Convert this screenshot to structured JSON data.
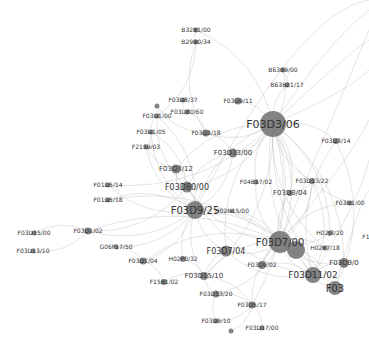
{
  "graph": {
    "type": "network",
    "node_color": "#6e6e6e",
    "edge_color": "#b8b8b8",
    "nodes": [
      {
        "id": "B32B1/00",
        "label": "B32B1/00",
        "x": 196,
        "y": 30,
        "r": 2.5,
        "fs": 6
      },
      {
        "id": "B29B0/34",
        "label": "B29B0/34",
        "x": 196,
        "y": 42,
        "r": 2.5,
        "fs": 6
      },
      {
        "id": "B63B9/00",
        "label": "B63B9/00",
        "x": 283,
        "y": 70,
        "r": 2.5,
        "fs": 6
      },
      {
        "id": "B63B21/17",
        "label": "B63B21/17",
        "x": 287,
        "y": 85,
        "r": 2.5,
        "fs": 6
      },
      {
        "id": "F03D3/06",
        "label": "F03D3/06",
        "x": 273,
        "y": 124,
        "r": 13,
        "fs": 11
      },
      {
        "id": "F03D8/37",
        "label": "F03D8/37",
        "x": 183,
        "y": 100,
        "r": 2.5,
        "fs": 6
      },
      {
        "id": "F03D9/11",
        "label": "F03D9/11",
        "x": 238,
        "y": 101,
        "r": 3.5,
        "fs": 6
      },
      {
        "id": "F03D80/60",
        "label": "F03D80/60",
        "x": 187,
        "y": 112,
        "r": 2.5,
        "fs": 6
      },
      {
        "id": "F03D1/00",
        "label": "F03D1/00",
        "x": 157,
        "y": 116,
        "r": 2.5,
        "fs": 6
      },
      {
        "id": "F03D1/05",
        "label": "F03D1/05",
        "x": 151,
        "y": 132,
        "r": 2.5,
        "fs": 6
      },
      {
        "id": "F03D3/18",
        "label": "F03D3/18",
        "x": 206,
        "y": 133,
        "r": 3.5,
        "fs": 6
      },
      {
        "id": "F21S9/03",
        "label": "F21S9/03",
        "x": 146,
        "y": 147,
        "r": 2.5,
        "fs": 6
      },
      {
        "id": "F03D13/00",
        "label": "F03D13/00",
        "x": 233,
        "y": 153,
        "r": 4.5,
        "fs": 7
      },
      {
        "id": "F03D3/14",
        "label": "F03D3/14",
        "x": 336,
        "y": 141,
        "r": 3,
        "fs": 6
      },
      {
        "id": "F03D3/12",
        "label": "F03D3/12",
        "x": 176,
        "y": 169,
        "r": 4.5,
        "fs": 7
      },
      {
        "id": "F03D80/00",
        "label": "F03D80/00",
        "x": 187,
        "y": 187,
        "r": 5.5,
        "fs": 8
      },
      {
        "id": "F04B17/02",
        "label": "F04B17/02",
        "x": 256,
        "y": 182,
        "r": 2.5,
        "fs": 6
      },
      {
        "id": "F03D13/22",
        "label": "F03D13/22",
        "x": 312,
        "y": 181,
        "r": 3,
        "fs": 6
      },
      {
        "id": "F03D3/04",
        "label": "F03D3/04",
        "x": 290,
        "y": 193,
        "r": 3,
        "fs": 7
      },
      {
        "id": "F01D5/14",
        "label": "F01D5/14",
        "x": 108,
        "y": 185,
        "r": 2.5,
        "fs": 6
      },
      {
        "id": "F01D5/18",
        "label": "F01D5/18",
        "x": 108,
        "y": 200,
        "r": 2.5,
        "fs": 6
      },
      {
        "id": "F03D1/00b",
        "label": "F03D1/00",
        "x": 350,
        "y": 203,
        "r": 2.5,
        "fs": 6
      },
      {
        "id": "F03D9/25",
        "label": "F03D9/25",
        "x": 195,
        "y": 210,
        "r": 9,
        "fs": 10
      },
      {
        "id": "H02N15/00",
        "label": "H02N15/00",
        "x": 232,
        "y": 211,
        "r": 2,
        "fs": 6
      },
      {
        "id": "F03D15/00",
        "label": "F03D15/00",
        "x": 34,
        "y": 233,
        "r": 2.5,
        "fs": 6
      },
      {
        "id": "F03D1/02",
        "label": "F03D1/02",
        "x": 88,
        "y": 231,
        "r": 3.5,
        "fs": 6
      },
      {
        "id": "F03D13/10",
        "label": "F03D13/10",
        "x": 33,
        "y": 251,
        "r": 2.5,
        "fs": 6
      },
      {
        "id": "G06F17/50",
        "label": "G06F17/50",
        "x": 116,
        "y": 247,
        "r": 2.5,
        "fs": 6
      },
      {
        "id": "F03D1/04",
        "label": "F03D1/04",
        "x": 143,
        "y": 261,
        "r": 3.5,
        "fs": 6
      },
      {
        "id": "F03D7/04",
        "label": "F03D7/04",
        "x": 226,
        "y": 251,
        "r": 5.5,
        "fs": 8
      },
      {
        "id": "H02P0/32",
        "label": "H02P0/32",
        "x": 183,
        "y": 259,
        "r": 3,
        "fs": 6
      },
      {
        "id": "F03D7/00",
        "label": "F03D7/00",
        "x": 280,
        "y": 242,
        "r": 11,
        "fs": 10
      },
      {
        "id": "F03D7/00b",
        "label": "",
        "x": 296,
        "y": 250,
        "r": 9,
        "fs": 0
      },
      {
        "id": "H02J3/20",
        "label": "H02J3/20",
        "x": 330,
        "y": 233,
        "r": 2.5,
        "fs": 6
      },
      {
        "id": "F1",
        "label": "F1",
        "x": 366,
        "y": 237,
        "r": 0,
        "fs": 6
      },
      {
        "id": "H02K7/18",
        "label": "H02K7/18",
        "x": 325,
        "y": 248,
        "r": 2.5,
        "fs": 6
      },
      {
        "id": "F03D9/02",
        "label": "F03D9/02",
        "x": 262,
        "y": 265,
        "r": 4,
        "fs": 6
      },
      {
        "id": "F03D9/0x",
        "label": "F03D9/0",
        "x": 344,
        "y": 263,
        "r": 5,
        "fs": 7
      },
      {
        "id": "F03D11/02",
        "label": "F03D11/02",
        "x": 313,
        "y": 275,
        "r": 8,
        "fs": 9
      },
      {
        "id": "F03",
        "label": "F03",
        "x": 335,
        "y": 288,
        "r": 7,
        "fs": 10
      },
      {
        "id": "F03D15/10",
        "label": "F03D15/10",
        "x": 204,
        "y": 276,
        "r": 4,
        "fs": 7
      },
      {
        "id": "F15B1/02",
        "label": "F15B1/02",
        "x": 164,
        "y": 282,
        "r": 3,
        "fs": 6
      },
      {
        "id": "F03D13/20",
        "label": "F03D13/20",
        "x": 216,
        "y": 294,
        "r": 3.5,
        "fs": 6
      },
      {
        "id": "F03D5/17",
        "label": "F03D5/17",
        "x": 252,
        "y": 305,
        "r": 3.5,
        "fs": 6
      },
      {
        "id": "F03D9/10",
        "label": "F03D9/10",
        "x": 216,
        "y": 321,
        "r": 2.5,
        "fs": 6
      },
      {
        "id": "F03D17/00",
        "label": "F03D17/00",
        "x": 262,
        "y": 328,
        "r": 2.5,
        "fs": 6
      },
      {
        "id": "iso1",
        "label": "",
        "x": 231,
        "y": 331,
        "r": 2.5,
        "fs": 0
      },
      {
        "id": "iso2",
        "label": "",
        "x": 157,
        "y": 106,
        "r": 2.5,
        "fs": 0
      }
    ],
    "edges": [
      [
        "F03D3/06",
        "F03D7/00"
      ],
      [
        "F03D3/06",
        "F03D9/25"
      ],
      [
        "F03D3/06",
        "F03D80/00"
      ],
      [
        "F03D3/06",
        "F03D11/02"
      ],
      [
        "F03D3/06",
        "F03D13/00"
      ],
      [
        "F03D3/06",
        "F03D3/12"
      ],
      [
        "F03D3/06",
        "F03D3/18"
      ],
      [
        "F03D3/06",
        "F03D9/11"
      ],
      [
        "F03D3/06",
        "F03D3/04"
      ],
      [
        "F03D3/06",
        "F03D13/22"
      ],
      [
        "F03D3/06",
        "F03D3/14"
      ],
      [
        "F03D3/06",
        "F03D1/00b"
      ],
      [
        "F03D3/06",
        "H02J3/20"
      ],
      [
        "F03D3/06",
        "H02K7/18"
      ],
      [
        "F03D3/06",
        "F03D9/02"
      ],
      [
        "F03D3/06",
        "F03D7/04"
      ],
      [
        "F03D3/06",
        "F03D15/10"
      ],
      [
        "F03D3/06",
        "F03"
      ],
      [
        "F03D3/06",
        "B63B21/17"
      ],
      [
        "F03D3/06",
        "B63B9/00"
      ],
      [
        "F03D3/06",
        "F03D9/0x"
      ],
      [
        "F03D3/06",
        "F04B17/02"
      ],
      [
        "F03D3/06",
        "F03D5/17"
      ],
      [
        "F03D3/06",
        "B32B1/00"
      ],
      [
        "F03D9/25",
        "F03D7/00"
      ],
      [
        "F03D9/25",
        "F03D80/00"
      ],
      [
        "F03D9/25",
        "F03D1/02"
      ],
      [
        "F03D9/25",
        "F03D7/04"
      ],
      [
        "F03D9/25",
        "F03D1/04"
      ],
      [
        "F03D9/25",
        "F03D13/00"
      ],
      [
        "F03D9/25",
        "F03D3/12"
      ],
      [
        "F03D9/25",
        "H02N15/00"
      ],
      [
        "F03D9/25",
        "F03D11/02"
      ],
      [
        "F03D9/25",
        "H02P0/32"
      ],
      [
        "F03D9/25",
        "F01D5/14"
      ],
      [
        "F03D9/25",
        "F01D5/18"
      ],
      [
        "F03D9/25",
        "F03D1/05"
      ],
      [
        "F03D9/25",
        "F03D1/00"
      ],
      [
        "F03D9/25",
        "G06F17/50"
      ],
      [
        "F03D9/25",
        "F03D15/10"
      ],
      [
        "F03D9/25",
        "F21S9/03"
      ],
      [
        "F03D7/00",
        "F03D11/02"
      ],
      [
        "F03D7/00",
        "F03D7/04"
      ],
      [
        "F03D7/00",
        "F03D9/02"
      ],
      [
        "F03D7/00",
        "H02K7/18"
      ],
      [
        "F03D7/00",
        "H02J3/20"
      ],
      [
        "F03D7/00",
        "F03D80/00"
      ],
      [
        "F03D7/00",
        "F03D15/10"
      ],
      [
        "F03D7/00",
        "F03"
      ],
      [
        "F03D7/00",
        "F03D5/17"
      ],
      [
        "F03D7/00",
        "F03D13/20"
      ],
      [
        "F03D7/00",
        "F03D9/0x"
      ],
      [
        "F03D7/00",
        "F03D3/04"
      ],
      [
        "F03D7/00",
        "F03D13/22"
      ],
      [
        "F03D7/00",
        "F03D1/00b"
      ],
      [
        "F03D1/02",
        "F03D15/00"
      ],
      [
        "F03D1/02",
        "F03D13/10"
      ],
      [
        "F03D1/02",
        "F03D80/00"
      ],
      [
        "F03D1/02",
        "F03D7/00"
      ],
      [
        "F03D80/00",
        "F03D3/12"
      ],
      [
        "F03D80/00",
        "F03D13/00"
      ],
      [
        "F03D80/00",
        "F03D11/02"
      ],
      [
        "F03D80/00",
        "F03D1/00"
      ],
      [
        "F03D80/00",
        "F03D1/05"
      ],
      [
        "F03D5/17",
        "F03D17/00"
      ],
      [
        "F03D5/17",
        "F03D13/20"
      ],
      [
        "F03D5/17",
        "F03D9/10"
      ],
      [
        "F03D5/17",
        "F03D15/10"
      ],
      [
        "F03D5/17",
        "iso1"
      ],
      [
        "F03D13/20",
        "F03D9/10"
      ],
      [
        "F03D13/20",
        "F03D15/10"
      ],
      [
        "F03D15/10",
        "F15B1/02"
      ],
      [
        "F03D15/10",
        "F03D7/04"
      ],
      [
        "F03D15/10",
        "H02P0/32"
      ],
      [
        "F03D1/04",
        "F15B1/02"
      ],
      [
        "F03D1/04",
        "G06F17/50"
      ],
      [
        "F03D1/04",
        "F03D7/00"
      ],
      [
        "B32B1/00",
        "B29B0/34"
      ],
      [
        "B29B0/34",
        "F03D1/00"
      ],
      [
        "B29B0/34",
        "F03D3/18"
      ],
      [
        "B63B9/00",
        "B63B21/17"
      ],
      [
        "F03D8/37",
        "F03D80/60"
      ],
      [
        "F03D80/60",
        "F03D3/18"
      ],
      [
        "F03D1/00",
        "F03D1/05"
      ],
      [
        "F03D1/05",
        "F21S9/03"
      ],
      [
        "F21S9/03",
        "F03D3/12"
      ],
      [
        "iso2",
        "F03D1/00"
      ],
      [
        "iso2",
        "F03D3/18"
      ],
      [
        "F03D3/18",
        "F03D13/00"
      ],
      [
        "F03D11/02",
        "F03"
      ],
      [
        "F03D11/02",
        "F03D9/0x"
      ],
      [
        "F03D11/02",
        "F03D9/02"
      ],
      [
        "F03D11/02",
        "F03D7/04"
      ],
      [
        "F03D11/02",
        "F03D13/22"
      ],
      [
        "F03D7/00b",
        "F03D11/02"
      ],
      [
        "F03D7/00b",
        "F03D7/00"
      ],
      [
        "F03D13/22",
        "F03D3/04"
      ],
      [
        "F04B17/02",
        "F03D7/00"
      ],
      [
        "H02N15/00",
        "F03D7/00"
      ],
      [
        "F01D5/14",
        "F03D3/06"
      ],
      [
        "F01D5/18",
        "F03D7/00"
      ],
      [
        "F03D3/14",
        "F03D11/02"
      ],
      [
        "F03D3/14",
        "F03"
      ]
    ]
  }
}
